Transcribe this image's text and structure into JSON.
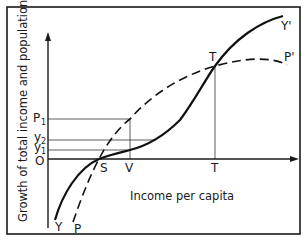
{
  "diagram": {
    "y_axis_label": "Growth of total income and population",
    "x_axis_label": "Income per capita",
    "origin_label": "O",
    "y_ticks": {
      "p1": {
        "base": "P",
        "sub": "1"
      },
      "y2": {
        "base": "y",
        "sub": "2"
      },
      "y1": {
        "base": "y",
        "sub": "1"
      }
    },
    "x_ticks": {
      "s": "S",
      "v": "V",
      "t": "T"
    },
    "point_labels": {
      "t_intersection": "T"
    },
    "curves": {
      "income_start": "Y",
      "income_end": "Y'",
      "population_start": "P",
      "population_end": "P'"
    },
    "legend": {
      "income_style": "solid",
      "population_style": "dashed"
    },
    "colors": {
      "ink": "#1a1a1a",
      "background": "#ffffff"
    }
  }
}
